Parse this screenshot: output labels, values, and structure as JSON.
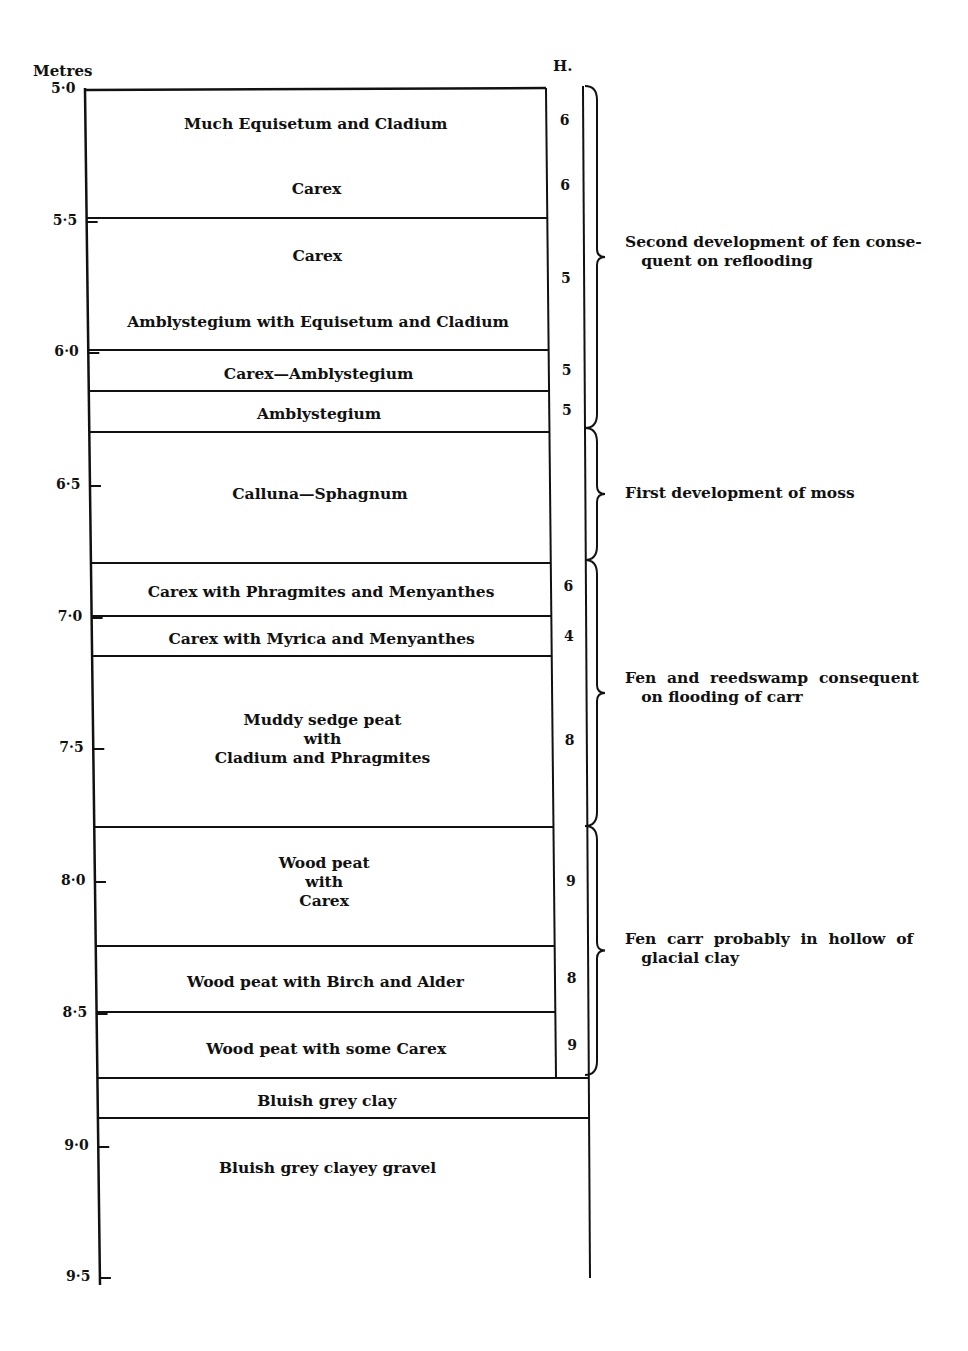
{
  "axis": {
    "title": "Metres",
    "h_column_title": "H.",
    "ticks": [
      {
        "label": "5·0",
        "y": 90
      },
      {
        "label": "5·5",
        "y": 222
      },
      {
        "label": "6·0",
        "y": 353
      },
      {
        "label": "6·5",
        "y": 486
      },
      {
        "label": "7·0",
        "y": 618
      },
      {
        "label": "7·5",
        "y": 749
      },
      {
        "label": "8·0",
        "y": 882
      },
      {
        "label": "8·5",
        "y": 1014
      },
      {
        "label": "9·0",
        "y": 1147
      },
      {
        "label": "9·5",
        "y": 1278
      }
    ]
  },
  "layers": [
    {
      "label": "Much Equisetum and Cladium",
      "top": 90,
      "bottom": 218,
      "text_y": 114,
      "h": "6",
      "h_y": 112
    },
    {
      "label": "Carex",
      "top": 90,
      "bottom": 218,
      "text_y": 179,
      "h": "6",
      "h_y": 177
    },
    {
      "label": "Carex",
      "top": 218,
      "bottom": 350,
      "text_y": 246,
      "h": "",
      "h_y": 0
    },
    {
      "label": "Amblystegium with Equisetum and Cladium",
      "top": 218,
      "bottom": 350,
      "text_y": 312,
      "h": "5",
      "h_y": 270
    },
    {
      "label": "Carex—Amblystegium",
      "top": 350,
      "bottom": 391,
      "text_y": 364,
      "h": "5",
      "h_y": 362
    },
    {
      "label": "Amblystegium",
      "top": 391,
      "bottom": 432,
      "text_y": 404,
      "h": "5",
      "h_y": 402
    },
    {
      "label": "Calluna—Sphagnum",
      "top": 432,
      "bottom": 563,
      "text_y": 484,
      "h": "",
      "h_y": 0
    },
    {
      "label": "Carex with Phragmites and Menyanthes",
      "top": 563,
      "bottom": 616,
      "text_y": 582,
      "h": "6",
      "h_y": 578
    },
    {
      "label": "Carex with Myrica and Menyanthes",
      "top": 616,
      "bottom": 656,
      "text_y": 629,
      "h": "4",
      "h_y": 628
    },
    {
      "label": "Muddy sedge peat\nwith\nCladium and Phragmites",
      "top": 656,
      "bottom": 827,
      "text_y": 710,
      "h": "8",
      "h_y": 732
    },
    {
      "label": "Wood peat\nwith\nCarex",
      "top": 827,
      "bottom": 946,
      "text_y": 853,
      "h": "9",
      "h_y": 873
    },
    {
      "label": "Wood peat with Birch and Alder",
      "top": 946,
      "bottom": 1012,
      "text_y": 972,
      "h": "8",
      "h_y": 970
    },
    {
      "label": "Wood peat with some Carex",
      "top": 1012,
      "bottom": 1078,
      "text_y": 1039,
      "h": "9",
      "h_y": 1037
    },
    {
      "label": "Bluish grey clay",
      "top": 1078,
      "bottom": 1118,
      "text_y": 1091,
      "h": "",
      "h_y": 0
    },
    {
      "label": "Bluish grey clayey gravel",
      "top": 1118,
      "bottom": 1278,
      "text_y": 1158,
      "h": "",
      "h_y": 0
    }
  ],
  "interpretations": [
    {
      "text": "Second development of fen conse-\n   quent on reflooding",
      "brace_top": 86,
      "brace_bottom": 428,
      "text_y": 232
    },
    {
      "text": "First development of moss",
      "brace_top": 428,
      "brace_bottom": 560,
      "text_y": 483
    },
    {
      "text": "Fen  and  reedswamp  consequent\n   on flooding of carr",
      "brace_top": 560,
      "brace_bottom": 826,
      "text_y": 668
    },
    {
      "text": "Fen  carr  probably  in  hollow  of\n   glacial clay",
      "brace_top": 826,
      "brace_bottom": 1075,
      "text_y": 929
    }
  ],
  "chart_data": {
    "type": "table",
    "xlabel": "",
    "ylabel": "Metres",
    "ylim": [
      5.0,
      9.5
    ],
    "columns": [
      "Depth from (m)",
      "Depth to (m)",
      "Layer",
      "H."
    ],
    "rows": [
      [
        5.0,
        5.5,
        "Much Equisetum and Cladium / Carex",
        "6 / 6"
      ],
      [
        5.5,
        6.0,
        "Carex / Amblystegium with Equisetum and Cladium",
        "5"
      ],
      [
        6.0,
        6.15,
        "Carex—Amblystegium",
        "5"
      ],
      [
        6.15,
        6.3,
        "Amblystegium",
        "5"
      ],
      [
        6.3,
        6.8,
        "Calluna—Sphagnum",
        ""
      ],
      [
        6.8,
        7.0,
        "Carex with Phragmites and Menyanthes",
        "6"
      ],
      [
        7.0,
        7.15,
        "Carex with Myrica and Menyanthes",
        "4"
      ],
      [
        7.15,
        7.8,
        "Muddy sedge peat with Cladium and Phragmites",
        "8"
      ],
      [
        7.8,
        8.25,
        "Wood peat with Carex",
        "9"
      ],
      [
        8.25,
        8.5,
        "Wood peat with Birch and Alder",
        "8"
      ],
      [
        8.5,
        8.75,
        "Wood peat with some Carex",
        "9"
      ],
      [
        8.75,
        8.9,
        "Bluish grey clay",
        ""
      ],
      [
        8.9,
        9.5,
        "Bluish grey clayey gravel",
        ""
      ]
    ],
    "annotations": [
      {
        "range_m": [
          5.0,
          6.3
        ],
        "text": "Second development of fen consequent on reflooding"
      },
      {
        "range_m": [
          6.3,
          6.8
        ],
        "text": "First development of moss"
      },
      {
        "range_m": [
          6.8,
          7.8
        ],
        "text": "Fen and reedswamp consequent on flooding of carr"
      },
      {
        "range_m": [
          7.8,
          8.75
        ],
        "text": "Fen carr probably in hollow of glacial clay"
      }
    ]
  }
}
